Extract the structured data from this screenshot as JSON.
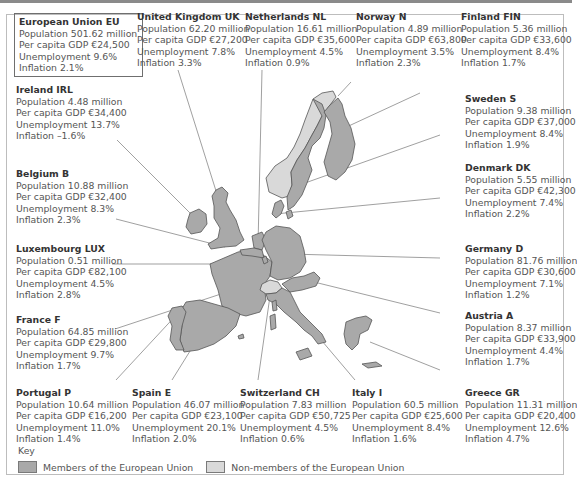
{
  "colors": {
    "member_fill": "#a9a9a9",
    "nonmember_fill": "#d9d9d9",
    "outline": "#555555",
    "leader_line": "#777777"
  },
  "eu": {
    "name": "European Union EU",
    "population": "Population 501.62 million",
    "gdp": "Per capita GDP €24,500",
    "unemployment": "Unemployment 9.6%",
    "inflation": "Inflation 2.1%"
  },
  "countries": [
    {
      "id": "uk",
      "name": "United Kingdom UK",
      "population": "Population 62.20 million",
      "gdp": "Per capita GDP €27,200",
      "unemployment": "Unemployment 7.8%",
      "inflation": "Inflation 3.3%",
      "member": true
    },
    {
      "id": "nl",
      "name": "Netherlands NL",
      "population": "Population 16.61 million",
      "gdp": "Per capita GDP €35,600",
      "unemployment": "Unemployment 4.5%",
      "inflation": "Inflation 0.9%",
      "member": true
    },
    {
      "id": "n",
      "name": "Norway N",
      "population": "Population 4.89 million",
      "gdp": "Per capita GDP €63,800",
      "unemployment": "Unemployment 3.5%",
      "inflation": "Inflation 2.3%",
      "member": false
    },
    {
      "id": "fin",
      "name": "Finland FIN",
      "population": "Population 5.36 million",
      "gdp": "Per capita GDP €33,600",
      "unemployment": "Unemployment 8.4%",
      "inflation": "Inflation 1.7%",
      "member": true
    },
    {
      "id": "irl",
      "name": "Ireland IRL",
      "population": "Population 4.48 million",
      "gdp": "Per capita GDP €34,400",
      "unemployment": "Unemployment 13.7%",
      "inflation": "Inflation –1.6%",
      "member": true
    },
    {
      "id": "s",
      "name": "Sweden S",
      "population": "Population 9.38 million",
      "gdp": "Per capita GDP €37,000",
      "unemployment": "Unemployment 8.4%",
      "inflation": "Inflation 1.9%",
      "member": true
    },
    {
      "id": "b",
      "name": "Belgium B",
      "population": "Population 10.88 million",
      "gdp": "Per capita GDP €32,400",
      "unemployment": "Unemployment 8.3%",
      "inflation": "Inflation 2.3%",
      "member": true
    },
    {
      "id": "dk",
      "name": "Denmark DK",
      "population": "Population 5.55 million",
      "gdp": "Per capita GDP €42,300",
      "unemployment": "Unemployment 7.4%",
      "inflation": "Inflation 2.2%",
      "member": true
    },
    {
      "id": "lux",
      "name": "Luxembourg LUX",
      "population": "Population 0.51 million",
      "gdp": "Per capita GDP €82,100",
      "unemployment": "Unemployment 4.5%",
      "inflation": "Inflation 2.8%",
      "member": true
    },
    {
      "id": "d",
      "name": "Germany D",
      "population": "Population 81.76 million",
      "gdp": "Per capita GDP €30,600",
      "unemployment": "Unemployment 7.1%",
      "inflation": "Inflation 1.2%",
      "member": true
    },
    {
      "id": "f",
      "name": "France F",
      "population": "Population 64.85 million",
      "gdp": "Per capita GDP €29,800",
      "unemployment": "Unemployment 9.7%",
      "inflation": "Inflation 1.7%",
      "member": true
    },
    {
      "id": "a",
      "name": "Austria A",
      "population": "Population 8.37 million",
      "gdp": "Per capita GDP €33,900",
      "unemployment": "Unemployment 4.4%",
      "inflation": "Inflation 1.7%",
      "member": true
    },
    {
      "id": "p",
      "name": "Portugal P",
      "population": "Population 10.64 million",
      "gdp": "Per capita GDP €16,200",
      "unemployment": "Unemployment 11.0%",
      "inflation": "Inflation 1.4%",
      "member": true
    },
    {
      "id": "e",
      "name": "Spain E",
      "population": "Population 46.07 million",
      "gdp": "Per capita GDP €23,100",
      "unemployment": "Unemployment 20.1%",
      "inflation": "Inflation 2.0%",
      "member": true
    },
    {
      "id": "ch",
      "name": "Switzerland CH",
      "population": "Population 7.83 million",
      "gdp": "Per capita GDP €50,725",
      "unemployment": "Unemployment 4.5%",
      "inflation": "Inflation 0.6%",
      "member": false
    },
    {
      "id": "i",
      "name": "Italy I",
      "population": "Population 60.5 million",
      "gdp": "Per capita GDP €25,600",
      "unemployment": "Unemployment 8.4%",
      "inflation": "Inflation 1.6%",
      "member": true
    },
    {
      "id": "gr",
      "name": "Greece GR",
      "population": "Population 11.31 million",
      "gdp": "Per capita GDP €20,400",
      "unemployment": "Unemployment 12.6%",
      "inflation": "Inflation 4.7%",
      "member": true
    }
  ],
  "key": {
    "title": "Key",
    "member_label": "Members of the European Union",
    "nonmember_label": "Non-members of the European Union"
  }
}
